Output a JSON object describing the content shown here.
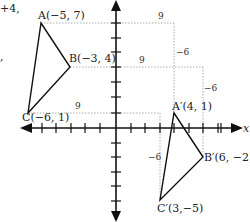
{
  "fragments": {
    "top_left": "+4,",
    "comma": ","
  },
  "axes": {
    "x_label": "x"
  },
  "original_triangle": {
    "A": {
      "label": "A(−5, 7)",
      "x": -5,
      "y": 7
    },
    "B": {
      "label": "B(−3, 4)",
      "x": -3,
      "y": 4
    },
    "C": {
      "label": "C(−6, 1)",
      "x": -6,
      "y": 1
    }
  },
  "image_triangle": {
    "A": {
      "label": "A′(4, 1)",
      "x": 4,
      "y": 1
    },
    "B": {
      "label": "B′(6, −2)",
      "x": 6,
      "y": -2
    },
    "C": {
      "label": "C′(3,−5)",
      "x": 3,
      "y": -5
    }
  },
  "translation_labels": {
    "A_horizontal": "9",
    "A_vertical": "−6",
    "B_horizontal": "9",
    "B_vertical": "−6",
    "C_horizontal": "9",
    "C_vertical": "−6"
  }
}
